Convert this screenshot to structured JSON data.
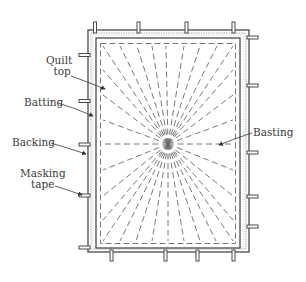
{
  "diagram": {
    "type": "quilt basting layout",
    "labels": {
      "quilt_top_line1": "Quilt",
      "quilt_top_line2": "top",
      "batting": "Batting",
      "backing": "Backing",
      "masking_tape_line1": "Masking",
      "masking_tape_line2": "tape",
      "basting": "Basting"
    },
    "colors": {
      "line": "#4a4a4a",
      "dash": "#6a6a6a",
      "batting_texture": "#9a9a9a",
      "background": "#ffffff"
    },
    "layers": [
      "Backing",
      "Batting",
      "Quilt top"
    ],
    "basting_pattern": "radial sunburst from center with dashed perimeter",
    "tape_pieces": {
      "top": 4,
      "bottom": 4,
      "left": 5,
      "right": 5
    }
  }
}
